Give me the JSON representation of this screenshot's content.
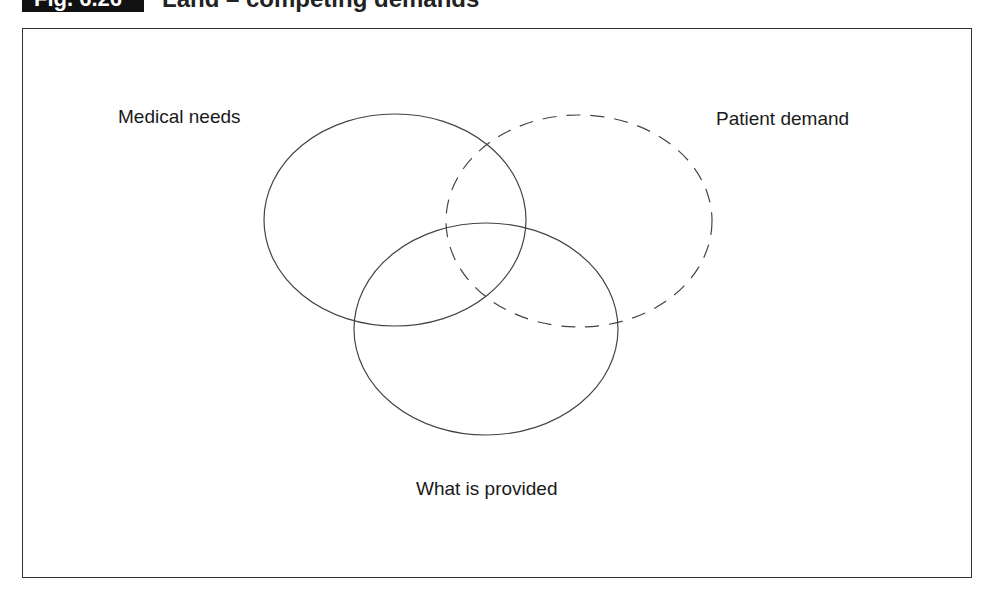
{
  "figure": {
    "number": "Fig. 6.26",
    "title": "Land – competing demands"
  },
  "diagram": {
    "type": "venn",
    "sets": [
      {
        "id": "medical-needs",
        "label": "Medical needs",
        "line_style": "solid",
        "cx": 395,
        "cy": 220,
        "rx": 131,
        "ry": 106
      },
      {
        "id": "patient-demand",
        "label": "Patient demand",
        "line_style": "dashed",
        "cx": 579,
        "cy": 221,
        "rx": 133,
        "ry": 106
      },
      {
        "id": "what-is-provided",
        "label": "What is provided",
        "line_style": "solid",
        "cx": 486,
        "cy": 329,
        "rx": 132,
        "ry": 106
      }
    ],
    "stroke_color": "#444444"
  },
  "labels": {
    "medical_needs": "Medical needs",
    "patient_demand": "Patient demand",
    "what_is_provided": "What is provided"
  }
}
